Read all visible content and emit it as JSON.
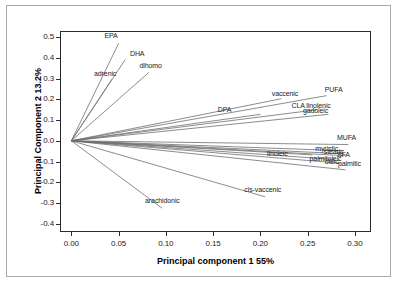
{
  "chart_data": {
    "type": "scatter",
    "title": "",
    "subtitle": "",
    "xlabel": "Principal component 1  55%",
    "ylabel": "Principal  Component 2  13.2%",
    "xlim": [
      -0.012,
      0.317
    ],
    "ylim": [
      -0.44,
      0.53
    ],
    "xticks": [
      "0.00",
      "0.05",
      "0.10",
      "0.15",
      "0.20",
      "0.25",
      "0.30"
    ],
    "xtick_values": [
      0.0,
      0.05,
      0.1,
      0.15,
      0.2,
      0.25,
      0.3
    ],
    "yticks": [
      "0.5",
      "0.4",
      "0.3",
      "0.2",
      "0.1",
      "0.0",
      "-0.1",
      "-0.2",
      "-0.3",
      "-0.4"
    ],
    "ytick_values": [
      0.5,
      0.4,
      0.3,
      0.2,
      0.1,
      0.0,
      -0.1,
      -0.2,
      -0.3,
      -0.4
    ],
    "grid": false,
    "legend": "none",
    "origin": [
      0.0,
      0.0
    ],
    "series_name": "PCA loadings",
    "line_color": "#6e6e6e",
    "vectors": [
      {
        "label": "EPA",
        "x": 0.05,
        "y": 0.47,
        "label_x": 0.042,
        "label_y": 0.508,
        "label_align": "center"
      },
      {
        "label": "DHA",
        "x": 0.057,
        "y": 0.392,
        "label_x": 0.062,
        "label_y": 0.418,
        "label_align": "left"
      },
      {
        "label": "dihomo",
        "x": 0.082,
        "y": 0.33,
        "label_x": 0.072,
        "label_y": 0.36,
        "label_align": "left"
      },
      {
        "label": "adrenic",
        "x": 0.043,
        "y": 0.298,
        "label_x": 0.024,
        "label_y": 0.322,
        "label_align": "left"
      },
      {
        "label": "vaccenic",
        "x": 0.222,
        "y": 0.203,
        "label_x": 0.212,
        "label_y": 0.225,
        "label_align": "left"
      },
      {
        "label": "PUFA",
        "x": 0.27,
        "y": 0.218,
        "label_x": 0.268,
        "label_y": 0.243,
        "label_align": "left"
      },
      {
        "label": "CLA linolenic",
        "x": 0.26,
        "y": 0.15,
        "label_x": 0.233,
        "label_y": 0.168,
        "label_align": "left"
      },
      {
        "label": "gadoleic",
        "x": 0.272,
        "y": 0.128,
        "label_x": 0.245,
        "label_y": 0.142,
        "label_align": "left"
      },
      {
        "label": "DPA",
        "x": 0.2,
        "y": 0.128,
        "label_x": 0.155,
        "label_y": 0.15,
        "label_align": "left"
      },
      {
        "label": "MUFA",
        "x": 0.293,
        "y": -0.018,
        "label_x": 0.281,
        "label_y": 0.012,
        "label_align": "left"
      },
      {
        "label": "myristic",
        "x": 0.288,
        "y": -0.048,
        "label_x": 0.258,
        "label_y": -0.038,
        "label_align": "left"
      },
      {
        "label": "stearic",
        "x": 0.286,
        "y": -0.062,
        "label_x": 0.267,
        "label_y": -0.056,
        "label_align": "left"
      },
      {
        "label": "SFA",
        "x": 0.29,
        "y": -0.072,
        "label_x": 0.281,
        "label_y": -0.066,
        "label_align": "left"
      },
      {
        "label": "linoleic",
        "x": 0.255,
        "y": -0.068,
        "label_x": 0.207,
        "label_y": -0.062,
        "label_align": "left"
      },
      {
        "label": "palmitoleic",
        "x": 0.278,
        "y": -0.09,
        "label_x": 0.252,
        "label_y": -0.086,
        "label_align": "left"
      },
      {
        "label": "oleic",
        "x": 0.285,
        "y": -0.108,
        "label_x": 0.268,
        "label_y": -0.104,
        "label_align": "left"
      },
      {
        "label": "palmitic",
        "x": 0.29,
        "y": -0.14,
        "label_x": 0.282,
        "label_y": -0.112,
        "label_align": "left"
      },
      {
        "label": "cis-vaccenic",
        "x": 0.205,
        "y": -0.27,
        "label_x": 0.183,
        "label_y": -0.238,
        "label_align": "left"
      },
      {
        "label": "arachidonic",
        "x": 0.096,
        "y": -0.325,
        "label_x": 0.078,
        "label_y": -0.288,
        "label_align": "left"
      }
    ]
  }
}
